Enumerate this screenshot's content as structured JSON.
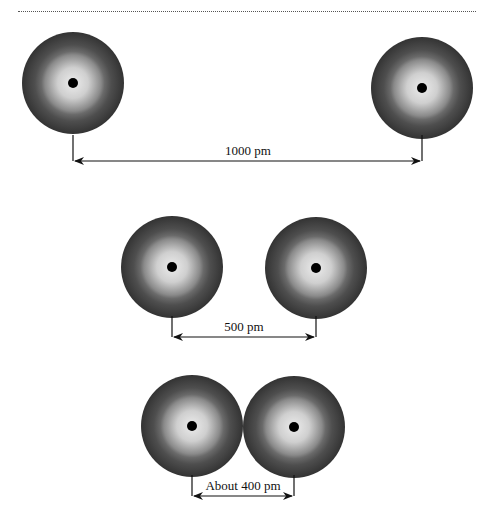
{
  "diagram": {
    "atom_style": {
      "outer_color": "#3a3a3a",
      "mid_color": "#6e6e6e",
      "inner_color": "#d6d6d6",
      "nucleus_color": "#000000",
      "radius": 51,
      "nucleus_radius": 5
    },
    "rows": [
      {
        "label": "1000 pm",
        "atoms": [
          {
            "cx": 73,
            "cy": 83
          },
          {
            "cx": 422,
            "cy": 88
          }
        ],
        "arrow": {
          "x1": 73,
          "x2": 422,
          "y": 161,
          "tick_top": 135,
          "tick_bottom": 161
        },
        "label_pos": {
          "x": 248,
          "y": 155
        }
      },
      {
        "label": "500 pm",
        "atoms": [
          {
            "cx": 172,
            "cy": 267
          },
          {
            "cx": 316,
            "cy": 268
          }
        ],
        "arrow": {
          "x1": 172,
          "x2": 316,
          "y": 337,
          "tick_top": 316,
          "tick_bottom": 337
        },
        "label_pos": {
          "x": 244,
          "y": 331
        }
      },
      {
        "label": "About 400 pm",
        "atoms": [
          {
            "cx": 192,
            "cy": 426
          },
          {
            "cx": 294,
            "cy": 427
          }
        ],
        "arrow": {
          "x1": 192,
          "x2": 294,
          "y": 496,
          "tick_top": 475,
          "tick_bottom": 496
        },
        "label_pos": {
          "x": 243,
          "y": 490
        }
      }
    ]
  }
}
